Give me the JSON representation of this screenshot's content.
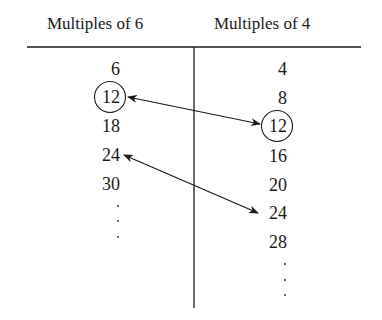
{
  "headers": {
    "left": "Multiples of 6",
    "right": "Multiples of 4"
  },
  "left_column": {
    "values": [
      "6",
      "12",
      "18",
      "24",
      "30"
    ],
    "circled_index": 1,
    "continues": true
  },
  "right_column": {
    "values": [
      "4",
      "8",
      "12",
      "16",
      "20",
      "24",
      "28"
    ],
    "circled_index": 2,
    "continues": true
  },
  "connections": [
    {
      "from": "left:12",
      "to": "right:12",
      "type": "double-arrow"
    },
    {
      "from": "left:24",
      "to": "right:24",
      "type": "double-arrow"
    }
  ]
}
